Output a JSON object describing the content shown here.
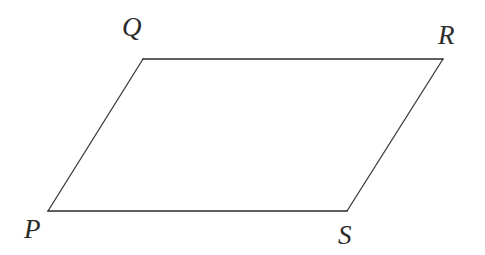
{
  "figure": {
    "kind": "parallelogram-diagram",
    "background_color": "#ffffff",
    "canvas": {
      "width": 485,
      "height": 255
    },
    "stroke_color_solid": "#2b2b2b",
    "stroke_color_diagonal": "#3a3a3a",
    "stroke_width_solid": 1.6,
    "stroke_width_diagonal": 1.3,
    "vertices": [
      {
        "id": "P",
        "label": "P",
        "x": 48,
        "y": 211,
        "label_x": 24,
        "label_y": 216
      },
      {
        "id": "Q",
        "label": "Q",
        "x": 143,
        "y": 59,
        "label_x": 122,
        "label_y": 14
      },
      {
        "id": "R",
        "label": "R",
        "x": 443,
        "y": 59,
        "label_x": 438,
        "label_y": 22
      },
      {
        "id": "S",
        "label": "S",
        "x": 347,
        "y": 211,
        "label_x": 338,
        "label_y": 222
      }
    ],
    "edges": [
      {
        "id": "PQ",
        "from": "P",
        "to": "Q",
        "style": "solid-thin"
      },
      {
        "id": "QR",
        "from": "Q",
        "to": "R",
        "style": "solid-thick"
      },
      {
        "id": "RS",
        "from": "R",
        "to": "S",
        "style": "solid-thin"
      },
      {
        "id": "SP",
        "from": "S",
        "to": "P",
        "style": "solid-thick"
      }
    ],
    "polygon_points": "48,211 143,59 443,59 347,211",
    "fill": "none"
  }
}
